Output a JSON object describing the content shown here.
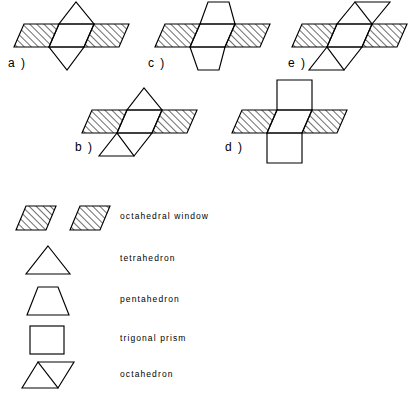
{
  "figures": [
    {
      "id": "a",
      "label": "a )",
      "top_shape": "tetrahedron",
      "bottom_shape": "tetrahedron",
      "left_window": "octahedral window",
      "right_window": "octahedral window"
    },
    {
      "id": "b",
      "label": "b )",
      "top_shape": "tetrahedron",
      "bottom_shape": "octahedron",
      "left_window": "octahedral window",
      "right_window": "octahedral window"
    },
    {
      "id": "c",
      "label": "c )",
      "top_shape": "pentahedron",
      "bottom_shape": "pentahedron",
      "left_window": "octahedral window",
      "right_window": "octahedral window"
    },
    {
      "id": "d",
      "label": "d )",
      "top_shape": "trigonal prism",
      "bottom_shape": "trigonal prism",
      "left_window": "octahedral window",
      "right_window": "octahedral window"
    },
    {
      "id": "e",
      "label": "e )",
      "top_shape": "octahedron",
      "bottom_shape": "octahedron",
      "left_window": "octahedral window",
      "right_window": "octahedral window"
    }
  ],
  "legend": {
    "items": [
      {
        "glyph": "two-hatched-parallelograms",
        "label": "octahedral window"
      },
      {
        "glyph": "triangle",
        "label": "tetrahedron"
      },
      {
        "glyph": "trapezoid",
        "label": "pentahedron"
      },
      {
        "glyph": "square",
        "label": "trigonal prism"
      },
      {
        "glyph": "parallelogram-with-diagonal",
        "label": "octahedron"
      }
    ]
  },
  "colors": {
    "ink": "#000000",
    "background": "#ffffff"
  }
}
